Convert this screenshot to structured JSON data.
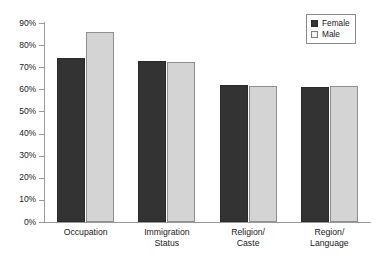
{
  "chart_data": {
    "type": "bar",
    "title": "",
    "subtitle": "",
    "xlabel": "",
    "ylabel": "",
    "categories": [
      "Occupation",
      "Immigration Status",
      "Religion/ Caste",
      "Region/ Language"
    ],
    "category_lines": [
      [
        "Occupation"
      ],
      [
        "Immigration",
        "Status"
      ],
      [
        "Religion/",
        "Caste"
      ],
      [
        "Region/",
        "Language"
      ]
    ],
    "series": [
      {
        "name": "Female",
        "values": [
          74,
          73,
          62,
          61
        ],
        "color": "#333333"
      },
      {
        "name": "Male",
        "values": [
          86,
          72.5,
          61.5,
          61.5
        ],
        "color": "#d4d4d4"
      }
    ],
    "ylim": [
      0,
      90
    ],
    "ytick_values": [
      0,
      10,
      20,
      30,
      40,
      50,
      60,
      70,
      80,
      90
    ],
    "ytick_labels": [
      "0%",
      "10%",
      "20%",
      "30%",
      "40%",
      "50%",
      "60%",
      "70%",
      "80%",
      "90%"
    ],
    "grid": false,
    "legend_position": "top-right",
    "legend_entries": [
      "Female",
      "Male"
    ]
  }
}
